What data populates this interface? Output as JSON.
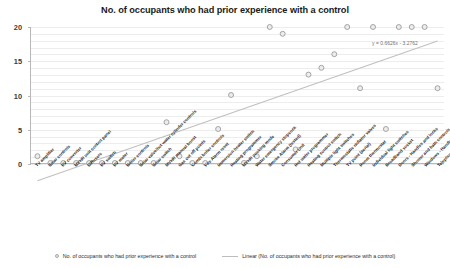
{
  "chart_data": {
    "type": "scatter",
    "title": "No. of occupants who had prior experience with a control",
    "xlabel": "",
    "ylabel": "",
    "ylim": [
      0,
      20
    ],
    "yticks": [
      0,
      5,
      10,
      15,
      20
    ],
    "grid": true,
    "legend_position": "bottom",
    "categories": [
      "TV amplifier",
      "Solar controls",
      "PV converter",
      "MVHR unit control panel",
      "Diffusers",
      "PV switch",
      "PV meter",
      "Boiler controls",
      "Solar valve/hot water cylinder controls",
      "Solar switch",
      "MVHR manual boost",
      "Gas cut off points",
      "Combi boiler controls",
      "Fire Alarm reset",
      "Immersion heater switch",
      "Heating programmer",
      "MVHR cooking mode",
      "Water emergency stopcock",
      "Smoke Alarm (tested)",
      "Consumer Unit",
      "Hot water programmer",
      "Heating control switch",
      "Multiple light switches",
      "Thermostatic radiator valves",
      "TV point (aerial)",
      "Room thermostat",
      "Individual light switches",
      "Broadband socket",
      "Doors - Handles and locks",
      "Shower and bath controls",
      "Windows - Handles and locks",
      "Telephone point"
    ],
    "series": [
      {
        "name": "No. of occupants who had prior experience with a control",
        "type": "scatter",
        "values": [
          1,
          0,
          0,
          0,
          0,
          0,
          0,
          0,
          0,
          0,
          6,
          1,
          0,
          0,
          5,
          10,
          0,
          1,
          20,
          19,
          2,
          13,
          14,
          16,
          20,
          11,
          20,
          5,
          20,
          20,
          20,
          11
        ]
      },
      {
        "name": "Linear (No. of occupants who had prior experience with a control)",
        "type": "line",
        "equation": "y = 0.6626x - 3.2762",
        "slope": 0.6626,
        "intercept": -3.2762
      }
    ],
    "legend": [
      "No. of occupants who had prior experience with a control",
      "Linear (No. of occupants who had prior experience with a control)"
    ],
    "annotation": "y = 0.6626x - 3.2762",
    "colors": {
      "marker_stroke": "#9a9a9a",
      "marker_fill": "#ededed",
      "trendline": "#c0c0c0",
      "grid": "#ededed",
      "axis": "#b8b8b8",
      "text": "#2b2b2b"
    }
  }
}
